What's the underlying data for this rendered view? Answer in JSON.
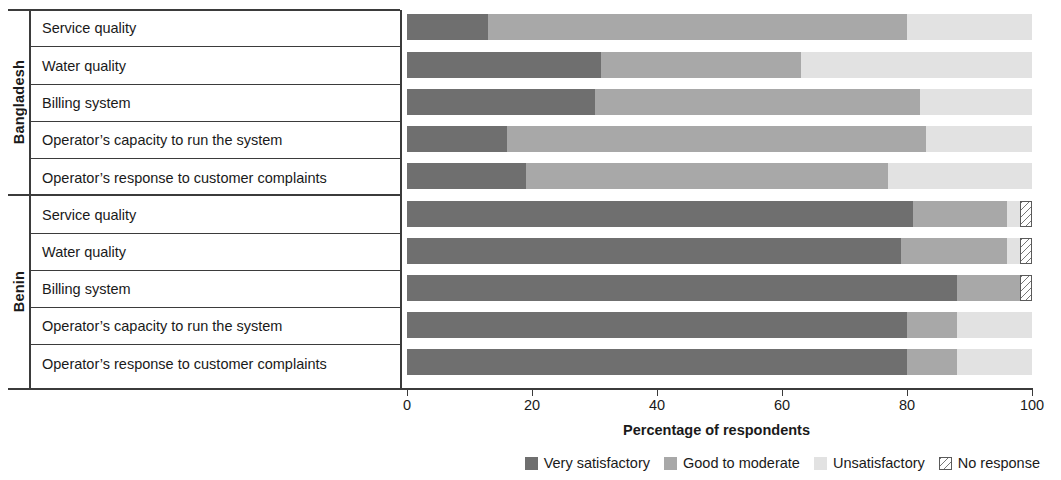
{
  "chart_data": {
    "type": "bar",
    "orientation": "horizontal",
    "stacked": true,
    "title": "",
    "xlabel": "Percentage of respondents",
    "ylabel": "",
    "xlim": [
      0,
      100
    ],
    "xticks": [
      0,
      20,
      40,
      60,
      80,
      100
    ],
    "grid": false,
    "legend_position": "bottom-right",
    "legend": [
      "Very satisfactory",
      "Good to moderate",
      "Unsatisfactory",
      "No response"
    ],
    "series": [
      {
        "name": "Very satisfactory",
        "color": "#6f6f6f",
        "values": [
          13,
          31,
          30,
          16,
          19,
          81,
          79,
          88,
          80,
          80
        ]
      },
      {
        "name": "Good to moderate",
        "color": "#a8a8a8",
        "values": [
          67,
          32,
          52,
          67,
          58,
          15,
          17,
          10,
          8,
          8
        ]
      },
      {
        "name": "Unsatisfactory",
        "color": "#e2e2e2",
        "values": [
          20,
          37,
          18,
          17,
          23,
          2,
          2,
          0,
          12,
          12
        ]
      },
      {
        "name": "No response",
        "color": "#ffffff",
        "values": [
          0,
          0,
          0,
          0,
          0,
          2,
          2,
          2,
          0,
          0
        ]
      }
    ],
    "groups": [
      {
        "name": "Bangladesh",
        "categories": [
          "Service quality",
          "Water quality",
          "Billing system",
          "Operator’s capacity to run the system",
          "Operator’s response to customer complaints"
        ]
      },
      {
        "name": "Benin",
        "categories": [
          "Service quality",
          "Water quality",
          "Billing system",
          "Operator’s capacity to run the system",
          "Operator’s response to customer complaints"
        ]
      }
    ]
  },
  "axis": {
    "x_title": "Percentage of respondents",
    "ticks": [
      "0",
      "20",
      "40",
      "60",
      "80",
      "100"
    ]
  },
  "legend": {
    "items": [
      {
        "label": "Very satisfactory",
        "color": "#6f6f6f"
      },
      {
        "label": "Good to moderate",
        "color": "#a8a8a8"
      },
      {
        "label": "Unsatisfactory",
        "color": "#e2e2e2"
      },
      {
        "label": "No response",
        "color": "#ffffff"
      }
    ]
  },
  "groups": {
    "bangladesh": "Bangladesh",
    "benin": "Benin"
  },
  "rows": [
    {
      "label": "Service quality"
    },
    {
      "label": "Water quality"
    },
    {
      "label": "Billing system"
    },
    {
      "label": "Operator’s capacity to run the system"
    },
    {
      "label": "Operator’s response to customer complaints"
    },
    {
      "label": "Service quality"
    },
    {
      "label": "Water quality"
    },
    {
      "label": "Billing system"
    },
    {
      "label": "Operator’s capacity to run the system"
    },
    {
      "label": "Operator’s response to customer complaints"
    }
  ]
}
